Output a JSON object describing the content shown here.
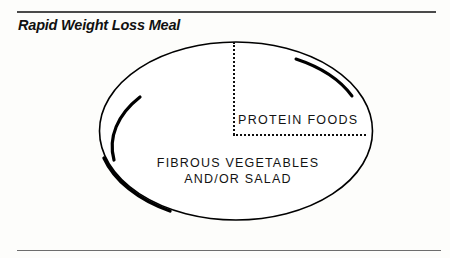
{
  "page": {
    "background_color": "#fdfdfb",
    "title": "Rapid Weight Loss Meal"
  },
  "rules": {
    "top_color": "#4a4a4a",
    "bottom_color": "#6d6d6d"
  },
  "diagram": {
    "name": "meal-plate-diagram",
    "shape": "plate-ellipse",
    "outline_color": "#000000",
    "segments": [
      {
        "id": "protein-section",
        "label": "PROTEIN FOODS",
        "position": "upper-right-quadrant"
      },
      {
        "id": "vegetable-section",
        "label_line_1": "FIBROUS VEGETABLES",
        "label_line_2": "AND/OR SALAD",
        "position": "lower-and-left-majority"
      }
    ],
    "dividers": {
      "vertical": "dotted",
      "horizontal": "dotted",
      "color": "#0d0d0d"
    }
  }
}
